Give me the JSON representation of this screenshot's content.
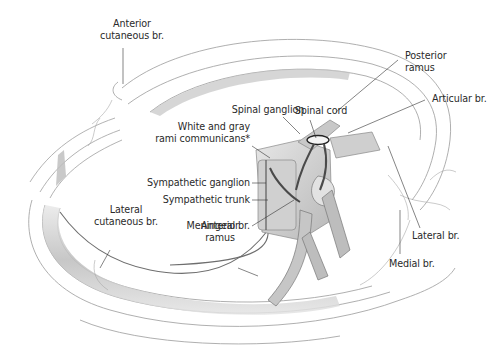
{
  "diagram": {
    "colors": {
      "background": "#ffffff",
      "label_text": "#2a2a2a",
      "leader_line": "#333333",
      "rib_outline": "#9a9a9a",
      "rib_shade": "#bdbdbd",
      "nerve_line": "#6e6e6e",
      "vertebra_fill": "#d8d8d8"
    },
    "labels": {
      "anterior_cutaneous_br": {
        "line1": "Anterior",
        "line2": "cutaneous br."
      },
      "spinal_cord": {
        "text": "Spinal cord"
      },
      "spinal_ganglion": {
        "text": "Spinal ganglion"
      },
      "rami_communicans": {
        "line1": "White and gray",
        "line2": "rami communicans*"
      },
      "sympathetic_ganglion": {
        "text": "Sympathetic ganglion"
      },
      "sympathetic_trunk": {
        "text": "Sympathetic trunk"
      },
      "meningeal_br": {
        "text": "Meningeal br."
      },
      "lateral_cutaneous_br": {
        "line1": "Lateral",
        "line2": "cutaneous br."
      },
      "anterior_ramus": {
        "line1": "Anterior",
        "line2": "ramus"
      },
      "posterior_ramus": {
        "line1": "Posterior",
        "line2": "ramus"
      },
      "articular_br": {
        "text": "Articular br."
      },
      "lateral_br": {
        "text": "Lateral br."
      },
      "medial_br": {
        "text": "Medial br."
      }
    }
  }
}
